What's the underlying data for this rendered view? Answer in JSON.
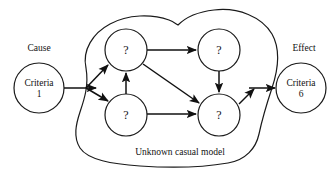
{
  "figure": {
    "type": "causal-block-diagram",
    "background_color": "#ffffff",
    "line_color": "#1a1a1a",
    "caption": "Unknown casual model",
    "cause_label": "Cause",
    "effect_label": "Effect"
  },
  "nodes": {
    "cause": {
      "id": "criteria-1",
      "line1": "Criteria",
      "line2": "1",
      "cx": 39,
      "cy": 88,
      "r": 25
    },
    "effect": {
      "id": "criteria-6",
      "line1": "Criteria",
      "line2": "6",
      "cx": 301,
      "cy": 88,
      "r": 25
    },
    "hidden": [
      {
        "id": "hidden-top-left",
        "label": "?",
        "cx": 126,
        "cy": 50,
        "r": 21
      },
      {
        "id": "hidden-top-right",
        "label": "?",
        "cx": 219,
        "cy": 50,
        "r": 21
      },
      {
        "id": "hidden-bottom-left",
        "label": "?",
        "cx": 126,
        "cy": 115,
        "r": 21
      },
      {
        "id": "hidden-bottom-right",
        "label": "?",
        "cx": 219,
        "cy": 115,
        "r": 21
      }
    ]
  },
  "edges": [
    {
      "id": "edge-cause-to-junction",
      "from": "criteria-1",
      "to": "junction"
    },
    {
      "id": "edge-junction-to-top-left",
      "from": "junction",
      "to": "hidden-top-left"
    },
    {
      "id": "edge-junction-to-bottom-left",
      "from": "junction",
      "to": "hidden-bottom-left"
    },
    {
      "id": "edge-top-left-to-top-right",
      "from": "hidden-top-left",
      "to": "hidden-top-right"
    },
    {
      "id": "edge-top-left-to-bottom-right",
      "from": "hidden-top-left",
      "to": "hidden-bottom-right"
    },
    {
      "id": "edge-bottom-left-to-top-left",
      "from": "hidden-bottom-left",
      "to": "hidden-top-left"
    },
    {
      "id": "edge-bottom-left-to-bottom-right",
      "from": "hidden-bottom-left",
      "to": "hidden-bottom-right"
    },
    {
      "id": "edge-top-right-to-bottom-right",
      "from": "hidden-top-right",
      "to": "hidden-bottom-right"
    },
    {
      "id": "edge-bottom-right-to-exit",
      "from": "hidden-bottom-right",
      "to": "exit-junction"
    },
    {
      "id": "edge-exit-to-effect",
      "from": "exit-junction",
      "to": "criteria-6"
    }
  ]
}
